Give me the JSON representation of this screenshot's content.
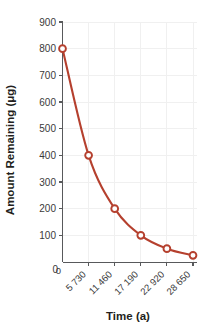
{
  "chart_data": {
    "type": "line",
    "title": "",
    "xlabel": "Time (a)",
    "ylabel": "Amount Remaining (μg)",
    "x": [
      0,
      5730,
      11460,
      17190,
      22920,
      28650
    ],
    "values": [
      800,
      400,
      200,
      100,
      50,
      25
    ],
    "xtick_labels": [
      "0",
      "5 730",
      "11 460",
      "17 190",
      "22 920",
      "28 650"
    ],
    "ytick_labels": [
      "0",
      "100",
      "200",
      "300",
      "400",
      "500",
      "600",
      "700",
      "800",
      "900"
    ],
    "ytick_values": [
      0,
      100,
      200,
      300,
      400,
      500,
      600,
      700,
      800,
      900
    ],
    "ylim": [
      0,
      900
    ],
    "xlim": [
      0,
      28650
    ],
    "grid": true,
    "legend": "none",
    "marker": "open-circle",
    "series_color": "#b5402e",
    "grid_color": "#f0f0f0",
    "axis_color": "#58595b"
  },
  "axes": {
    "y_title": "Amount Remaining (μg)",
    "x_title": "Time (a)"
  }
}
